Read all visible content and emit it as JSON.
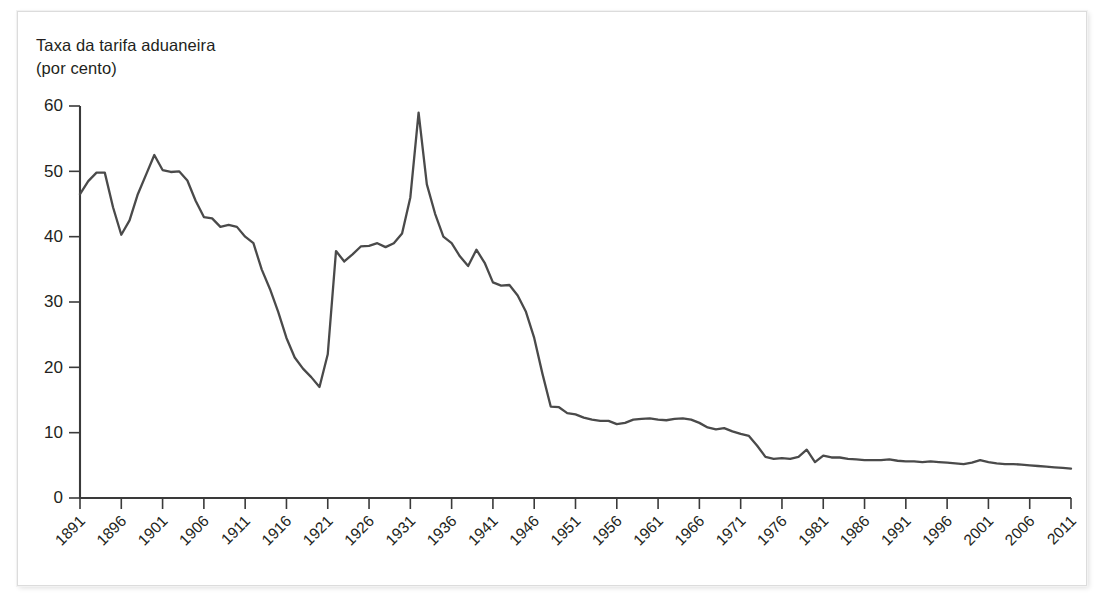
{
  "title": {
    "line1": "Taxa da tarifa aduaneira",
    "line2": "(por cento)"
  },
  "colors": {
    "line": "#4a4a4a",
    "axis": "#3a3a3a",
    "text": "#231f20",
    "background": "#ffffff",
    "frame": "#dcdcdc"
  },
  "chart_data": {
    "type": "line",
    "title": "Taxa da tarifa aduaneira (por cento)",
    "xlabel": "",
    "ylabel": "Taxa da tarifa aduaneira (por cento)",
    "xlim": [
      1891,
      2011
    ],
    "ylim": [
      0,
      60
    ],
    "yticks": [
      0,
      10,
      20,
      30,
      40,
      50,
      60
    ],
    "ytick_labels": [
      "0",
      "10",
      "20",
      "30",
      "40",
      "50",
      "60"
    ],
    "xticks": [
      1891,
      1896,
      1901,
      1906,
      1911,
      1916,
      1921,
      1926,
      1931,
      1936,
      1941,
      1946,
      1951,
      1956,
      1961,
      1966,
      1971,
      1976,
      1981,
      1986,
      1991,
      1996,
      2001,
      2006,
      2011
    ],
    "xtick_labels": [
      "1891",
      "1896",
      "1901",
      "1906",
      "1911",
      "1916",
      "1921",
      "1926",
      "1931",
      "1936",
      "1941",
      "1946",
      "1951",
      "1956",
      "1961",
      "1966",
      "1971",
      "1976",
      "1981",
      "1986",
      "1991",
      "1996",
      "2001",
      "2006",
      "2011"
    ],
    "grid": false,
    "legend": false,
    "series": [
      {
        "name": "Taxa da tarifa aduaneira",
        "x": [
          1891,
          1892,
          1893,
          1894,
          1895,
          1896,
          1897,
          1898,
          1899,
          1900,
          1901,
          1902,
          1903,
          1904,
          1905,
          1906,
          1907,
          1908,
          1909,
          1910,
          1911,
          1912,
          1913,
          1914,
          1915,
          1916,
          1917,
          1918,
          1919,
          1920,
          1921,
          1922,
          1923,
          1924,
          1925,
          1926,
          1927,
          1928,
          1929,
          1930,
          1931,
          1932,
          1933,
          1934,
          1935,
          1936,
          1937,
          1938,
          1939,
          1940,
          1941,
          1942,
          1943,
          1944,
          1945,
          1946,
          1947,
          1948,
          1949,
          1950,
          1951,
          1952,
          1953,
          1954,
          1955,
          1956,
          1957,
          1958,
          1959,
          1960,
          1961,
          1962,
          1963,
          1964,
          1965,
          1966,
          1967,
          1968,
          1969,
          1970,
          1971,
          1972,
          1973,
          1974,
          1975,
          1976,
          1977,
          1978,
          1979,
          1980,
          1981,
          1982,
          1983,
          1984,
          1985,
          1986,
          1987,
          1988,
          1989,
          1990,
          1991,
          1992,
          1993,
          1994,
          1995,
          1996,
          1997,
          1998,
          1999,
          2000,
          2001,
          2002,
          2003,
          2004,
          2005,
          2006,
          2007,
          2008,
          2009,
          2010,
          2011
        ],
        "values": [
          46.5,
          48.5,
          49.8,
          49.8,
          44.5,
          40.3,
          42.5,
          46.5,
          49.5,
          52.5,
          50.2,
          49.9,
          50.0,
          48.6,
          45.5,
          43.0,
          42.8,
          41.5,
          41.8,
          41.5,
          40.0,
          39.0,
          35.0,
          32.0,
          28.5,
          24.5,
          21.5,
          19.8,
          18.5,
          17.0,
          22.0,
          37.8,
          36.2,
          37.3,
          38.5,
          38.6,
          39.0,
          38.4,
          39.0,
          40.5,
          46.0,
          59.0,
          48.0,
          43.5,
          40.0,
          39.0,
          37.0,
          35.5,
          38.0,
          36.0,
          33.0,
          32.5,
          32.6,
          31.0,
          28.5,
          24.5,
          19.0,
          14.0,
          13.9,
          13.0,
          12.8,
          12.3,
          12.0,
          11.8,
          11.8,
          11.3,
          11.5,
          12.0,
          12.1,
          12.2,
          12.0,
          11.9,
          12.1,
          12.2,
          12.0,
          11.5,
          10.8,
          10.5,
          10.7,
          10.2,
          9.8,
          9.5,
          8.0,
          6.3,
          6.0,
          6.1,
          6.0,
          6.3,
          7.4,
          5.5,
          6.5,
          6.2,
          6.2,
          6.0,
          5.9,
          5.8,
          5.8,
          5.8,
          5.9,
          5.7,
          5.6,
          5.6,
          5.5,
          5.6,
          5.5,
          5.4,
          5.3,
          5.2,
          5.4,
          5.8,
          5.5,
          5.3,
          5.2,
          5.2,
          5.1,
          5.0,
          4.9,
          4.8,
          4.7,
          4.6,
          4.5
        ]
      }
    ]
  }
}
